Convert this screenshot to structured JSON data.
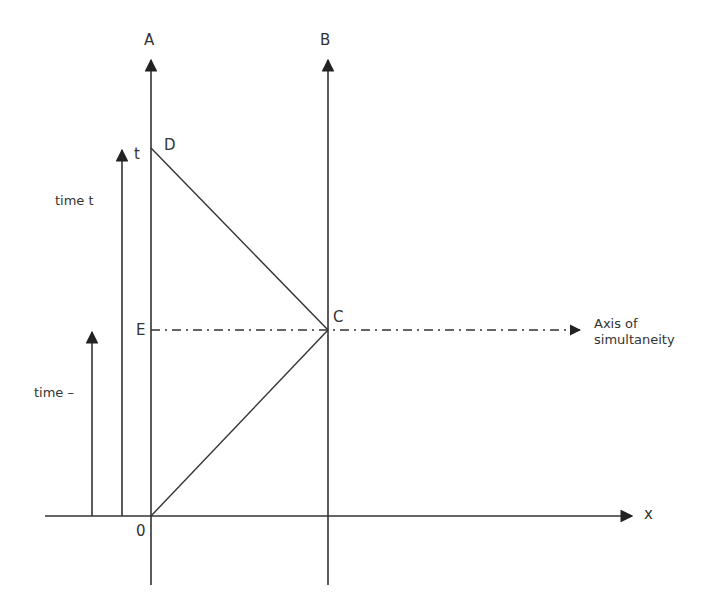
{
  "labels": {
    "A": "A",
    "B": "B",
    "D": "D",
    "t": "t",
    "E": "E",
    "C": "C",
    "O": "0",
    "x": "x",
    "time_t": "time t",
    "time_minus": "time –",
    "axis_line1": "Axis of",
    "axis_line2": "simultaneity"
  },
  "colors": {
    "line": "#333333",
    "text": "#333333"
  }
}
